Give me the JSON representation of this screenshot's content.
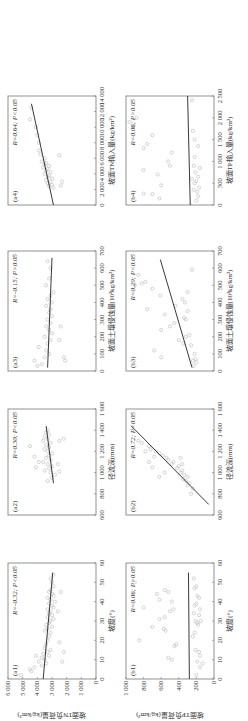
{
  "figure": {
    "rotation_deg": -90,
    "row_a_ylabel": "坡面TN负荷量(kg/km²)",
    "row_b_ylabel": "坡面TP负荷量(kg/km²)",
    "row_a_yticks": [
      "0",
      "1 000",
      "2 000",
      "3 000",
      "4 000",
      "5 000",
      "6 000"
    ],
    "row_b_yticks": [
      "0",
      "200",
      "400",
      "600",
      "800",
      "1 000"
    ]
  },
  "chart_data": [
    {
      "id": "a1",
      "type": "scatter",
      "label": "(a1)",
      "stat": "R=-0.32; P<0.05",
      "xlabel": "坡度(°)",
      "ylabel": "坡面TN负荷量(kg/km²)",
      "xlim": [
        0,
        60
      ],
      "ylim": [
        0,
        6000
      ],
      "xticks": [
        "0",
        "10",
        "20",
        "30",
        "40",
        "50",
        "60"
      ],
      "fit": [
        [
          0,
          3600
        ],
        [
          55,
          2950
        ]
      ],
      "points": [
        [
          2,
          5100
        ],
        [
          4,
          4400
        ],
        [
          5,
          4500
        ],
        [
          6,
          4200
        ],
        [
          7,
          3700
        ],
        [
          8,
          3400
        ],
        [
          9,
          3900
        ],
        [
          10,
          3500
        ],
        [
          11,
          3700
        ],
        [
          12,
          3200
        ],
        [
          12,
          4100
        ],
        [
          13,
          3600
        ],
        [
          14,
          3300
        ],
        [
          15,
          3100
        ],
        [
          16,
          3500
        ],
        [
          18,
          3400
        ],
        [
          20,
          3300
        ],
        [
          22,
          3200
        ],
        [
          24,
          3100
        ],
        [
          25,
          3500
        ],
        [
          26,
          3300
        ],
        [
          27,
          3000
        ],
        [
          28,
          3400
        ],
        [
          29,
          3200
        ],
        [
          30,
          3100
        ],
        [
          31,
          2900
        ],
        [
          32,
          3300
        ],
        [
          33,
          3000
        ],
        [
          34,
          3200
        ],
        [
          35,
          3100
        ],
        [
          36,
          3300
        ],
        [
          37,
          2900
        ],
        [
          38,
          3000
        ],
        [
          39,
          3200
        ],
        [
          40,
          2800
        ],
        [
          41,
          3100
        ],
        [
          42,
          3300
        ],
        [
          43,
          2900
        ],
        [
          44,
          3000
        ],
        [
          45,
          3200
        ],
        [
          46,
          3100
        ],
        [
          48,
          2900
        ],
        [
          50,
          3000
        ],
        [
          52,
          3100
        ],
        [
          54,
          2900
        ],
        [
          19,
          2500
        ],
        [
          14,
          2200
        ],
        [
          9,
          2300
        ],
        [
          35,
          2600
        ],
        [
          45,
          2400
        ]
      ]
    },
    {
      "id": "a2",
      "type": "scatter",
      "label": "(a2)",
      "stat": "R=0.30; P<0.05",
      "xlabel": "径流深(mm)",
      "ylabel": "",
      "xlim": [
        600,
        1600
      ],
      "ylim": [
        0,
        6000
      ],
      "xticks": [
        "600",
        "800",
        "1 000",
        "1 200",
        "1 400",
        "1 600"
      ],
      "fit": [
        [
          900,
          2900
        ],
        [
          1440,
          3400
        ]
      ],
      "points": [
        [
          920,
          3300
        ],
        [
          950,
          3000
        ],
        [
          980,
          2800
        ],
        [
          1000,
          3100
        ],
        [
          1020,
          3500
        ],
        [
          1040,
          3200
        ],
        [
          1060,
          3000
        ],
        [
          1080,
          3300
        ],
        [
          1100,
          3600
        ],
        [
          1120,
          3100
        ],
        [
          1140,
          3400
        ],
        [
          1160,
          3200
        ],
        [
          1180,
          3000
        ],
        [
          1200,
          3300
        ],
        [
          1220,
          3500
        ],
        [
          1240,
          3200
        ],
        [
          1260,
          3400
        ],
        [
          1280,
          3100
        ],
        [
          1300,
          3600
        ],
        [
          1320,
          3300
        ],
        [
          1340,
          3500
        ],
        [
          1360,
          3200
        ],
        [
          1380,
          3400
        ],
        [
          1400,
          3300
        ],
        [
          1100,
          3900
        ],
        [
          1150,
          4200
        ],
        [
          1050,
          4100
        ],
        [
          1010,
          2500
        ],
        [
          1080,
          2600
        ],
        [
          1300,
          2500
        ],
        [
          1320,
          2200
        ],
        [
          1250,
          4500
        ]
      ]
    },
    {
      "id": "a3",
      "type": "scatter",
      "label": "(a3)",
      "stat": "R=-0.15; P>0.05",
      "xlabel": "坡面土壤侵蚀量(10²kg/km²)",
      "ylabel": "",
      "xlim": [
        0,
        700
      ],
      "ylim": [
        0,
        6000
      ],
      "xticks": [
        "0",
        "100",
        "200",
        "300",
        "400",
        "500",
        "600",
        "700"
      ],
      "fit": [
        [
          20,
          3300
        ],
        [
          660,
          3000
        ]
      ],
      "points": [
        [
          30,
          4000
        ],
        [
          40,
          3700
        ],
        [
          60,
          4200
        ],
        [
          80,
          3500
        ],
        [
          100,
          3200
        ],
        [
          120,
          3400
        ],
        [
          140,
          3900
        ],
        [
          160,
          3300
        ],
        [
          180,
          3100
        ],
        [
          200,
          3500
        ],
        [
          220,
          3000
        ],
        [
          240,
          3200
        ],
        [
          260,
          3400
        ],
        [
          280,
          3100
        ],
        [
          300,
          3300
        ],
        [
          320,
          3000
        ],
        [
          340,
          3200
        ],
        [
          360,
          3100
        ],
        [
          380,
          3400
        ],
        [
          400,
          3000
        ],
        [
          420,
          3300
        ],
        [
          440,
          3100
        ],
        [
          460,
          2900
        ],
        [
          500,
          3400
        ],
        [
          540,
          3200
        ],
        [
          600,
          3100
        ],
        [
          640,
          3300
        ],
        [
          60,
          2100
        ],
        [
          80,
          2200
        ],
        [
          180,
          2500
        ],
        [
          260,
          2400
        ]
      ]
    },
    {
      "id": "a4",
      "type": "scatter",
      "label": "(a4)",
      "stat": "R=0.64; P<0.05",
      "xlabel": "坡面TN输入量(kg/km²)",
      "ylabel": "",
      "xlim": [
        0,
        14000
      ],
      "ylim": [
        0,
        6000
      ],
      "xticks": [
        "0",
        "2 000",
        "4 000",
        "6 000",
        "8 000",
        "10 000",
        "12 000",
        "14 000"
      ],
      "fit": [
        [
          0,
          2900
        ],
        [
          13000,
          4400
        ]
      ],
      "points": [
        [
          2200,
          2900
        ],
        [
          2400,
          3200
        ],
        [
          2600,
          3000
        ],
        [
          2800,
          3300
        ],
        [
          3000,
          3100
        ],
        [
          3200,
          3400
        ],
        [
          3400,
          3000
        ],
        [
          3600,
          3300
        ],
        [
          3800,
          3200
        ],
        [
          4000,
          3500
        ],
        [
          4200,
          3100
        ],
        [
          4400,
          3400
        ],
        [
          4600,
          3300
        ],
        [
          4800,
          3600
        ],
        [
          5000,
          3200
        ],
        [
          5200,
          3500
        ],
        [
          5400,
          3400
        ],
        [
          5600,
          3700
        ],
        [
          6000,
          3500
        ],
        [
          6500,
          3800
        ],
        [
          7000,
          3900
        ],
        [
          9000,
          4000
        ],
        [
          10000,
          4100
        ],
        [
          11000,
          4500
        ],
        [
          12500,
          4400
        ],
        [
          2500,
          2400
        ],
        [
          3000,
          2300
        ],
        [
          6400,
          2500
        ],
        [
          8000,
          3900
        ]
      ]
    },
    {
      "id": "b1",
      "type": "scatter",
      "label": "(b1)",
      "stat": "R=0.06; P>0.05",
      "xlabel": "坡度(°)",
      "ylabel": "坡面TP负荷量(kg/km²)",
      "xlim": [
        0,
        60
      ],
      "ylim": [
        0,
        1000
      ],
      "xticks": [
        "0",
        "10",
        "20",
        "30",
        "40",
        "50",
        "60"
      ],
      "fit": [
        [
          0,
          280
        ],
        [
          55,
          290
        ]
      ],
      "points": [
        [
          2,
          200
        ],
        [
          6,
          160
        ],
        [
          8,
          130
        ],
        [
          9,
          190
        ],
        [
          10,
          480
        ],
        [
          11,
          520
        ],
        [
          12,
          160
        ],
        [
          14,
          170
        ],
        [
          15,
          210
        ],
        [
          17,
          450
        ],
        [
          18,
          430
        ],
        [
          20,
          850
        ],
        [
          22,
          240
        ],
        [
          24,
          220
        ],
        [
          25,
          550
        ],
        [
          26,
          570
        ],
        [
          27,
          700
        ],
        [
          28,
          180
        ],
        [
          29,
          190
        ],
        [
          30,
          210
        ],
        [
          31,
          620
        ],
        [
          32,
          560
        ],
        [
          33,
          170
        ],
        [
          34,
          230
        ],
        [
          35,
          500
        ],
        [
          36,
          460
        ],
        [
          37,
          800
        ],
        [
          38,
          220
        ],
        [
          39,
          200
        ],
        [
          40,
          480
        ],
        [
          41,
          620
        ],
        [
          42,
          170
        ],
        [
          43,
          190
        ],
        [
          44,
          650
        ],
        [
          45,
          520
        ],
        [
          46,
          560
        ],
        [
          47,
          220
        ],
        [
          48,
          200
        ],
        [
          50,
          900
        ],
        [
          52,
          230
        ],
        [
          36,
          160
        ],
        [
          30,
          150
        ]
      ]
    },
    {
      "id": "b2",
      "type": "scatter",
      "label": "(b2)",
      "stat": "R=0.72; P<0.05",
      "xlabel": "径流深(mm)",
      "ylabel": "",
      "xlim": [
        600,
        1600
      ],
      "ylim": [
        0,
        1000
      ],
      "xticks": [
        "600",
        "800",
        "1 000",
        "1 200",
        "1 400",
        "1 600"
      ],
      "fit": [
        [
          700,
          60
        ],
        [
          1440,
          940
        ]
      ],
      "points": [
        [
          800,
          260
        ],
        [
          850,
          240
        ],
        [
          880,
          300
        ],
        [
          900,
          280
        ],
        [
          920,
          320
        ],
        [
          940,
          350
        ],
        [
          960,
          300
        ],
        [
          980,
          340
        ],
        [
          1000,
          380
        ],
        [
          1020,
          360
        ],
        [
          1040,
          420
        ],
        [
          1060,
          400
        ],
        [
          1080,
          480
        ],
        [
          1100,
          460
        ],
        [
          1120,
          520
        ],
        [
          1140,
          540
        ],
        [
          1160,
          580
        ],
        [
          1180,
          620
        ],
        [
          1200,
          660
        ],
        [
          1220,
          720
        ],
        [
          1250,
          740
        ],
        [
          1280,
          820
        ],
        [
          1300,
          860
        ],
        [
          1050,
          700
        ],
        [
          1100,
          740
        ],
        [
          1150,
          680
        ],
        [
          1200,
          780
        ],
        [
          960,
          620
        ],
        [
          1000,
          560
        ],
        [
          1140,
          380
        ],
        [
          1080,
          360
        ]
      ]
    },
    {
      "id": "b3",
      "type": "scatter",
      "label": "(b3)",
      "stat": "R=0.29; P<0.05",
      "xlabel": "坡面土壤侵蚀量(10²kg/km²)",
      "ylabel": "",
      "xlim": [
        0,
        700
      ],
      "ylim": [
        0,
        1000
      ],
      "xticks": [
        "0",
        "100",
        "200",
        "300",
        "400",
        "500",
        "600",
        "700"
      ],
      "fit": [
        [
          20,
          250
        ],
        [
          650,
          610
        ]
      ],
      "points": [
        [
          30,
          230
        ],
        [
          50,
          200
        ],
        [
          60,
          240
        ],
        [
          70,
          210
        ],
        [
          80,
          600
        ],
        [
          100,
          220
        ],
        [
          120,
          680
        ],
        [
          150,
          260
        ],
        [
          160,
          350
        ],
        [
          180,
          400
        ],
        [
          200,
          320
        ],
        [
          210,
          280
        ],
        [
          240,
          600
        ],
        [
          260,
          500
        ],
        [
          280,
          450
        ],
        [
          300,
          320
        ],
        [
          310,
          340
        ],
        [
          330,
          560
        ],
        [
          350,
          300
        ],
        [
          360,
          760
        ],
        [
          380,
          440
        ],
        [
          400,
          330
        ],
        [
          420,
          360
        ],
        [
          440,
          610
        ],
        [
          460,
          300
        ],
        [
          480,
          700
        ],
        [
          500,
          900
        ],
        [
          510,
          820
        ],
        [
          520,
          780
        ],
        [
          590,
          250
        ],
        [
          560,
          860
        ]
      ]
    },
    {
      "id": "b4",
      "type": "scatter",
      "label": "(b4)",
      "stat": "R=0.06; P>0.05",
      "xlabel": "坡面TP输入量(kg/km²)",
      "ylabel": "",
      "xlim": [
        0,
        2500
      ],
      "ylim": [
        0,
        1000
      ],
      "xticks": [
        "0",
        "500",
        "1 000",
        "1 500",
        "2 000",
        "2 500"
      ],
      "fit": [
        [
          0,
          270
        ],
        [
          2500,
          300
        ]
      ],
      "points": [
        [
          100,
          200
        ],
        [
          150,
          620
        ],
        [
          200,
          180
        ],
        [
          250,
          700
        ],
        [
          300,
          190
        ],
        [
          350,
          230
        ],
        [
          400,
          170
        ],
        [
          450,
          600
        ],
        [
          500,
          220
        ],
        [
          550,
          200
        ],
        [
          600,
          250
        ],
        [
          650,
          180
        ],
        [
          700,
          640
        ],
        [
          750,
          210
        ],
        [
          800,
          800
        ],
        [
          850,
          160
        ],
        [
          900,
          230
        ],
        [
          1000,
          520
        ],
        [
          1100,
          220
        ],
        [
          1200,
          480
        ],
        [
          1300,
          800
        ],
        [
          1350,
          180
        ],
        [
          1400,
          760
        ],
        [
          1500,
          220
        ],
        [
          1600,
          700
        ],
        [
          1700,
          240
        ],
        [
          1800,
          920
        ],
        [
          1900,
          960
        ],
        [
          2000,
          880
        ],
        [
          2400,
          250
        ],
        [
          260,
          800
        ],
        [
          900,
          500
        ]
      ]
    }
  ]
}
